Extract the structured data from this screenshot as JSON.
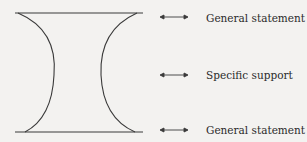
{
  "diagram": {
    "type": "hourglass paragraph structure",
    "colors": {
      "stroke": "#3a3a3a",
      "background": "#f3f2f0",
      "text": "#2a2a2a"
    },
    "labels": [
      {
        "text": "General statement",
        "arrow": "double-arrow-icon"
      },
      {
        "text": "Specific support",
        "arrow": "double-arrow-icon"
      },
      {
        "text": "General statement",
        "arrow": "double-arrow-icon"
      }
    ]
  }
}
